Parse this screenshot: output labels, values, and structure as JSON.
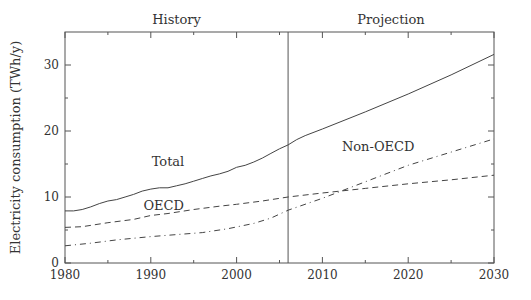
{
  "chart_data": {
    "type": "line",
    "title": "",
    "xlabel": "",
    "ylabel": "Electricity consumption (TWh/y)",
    "xlim": [
      1980,
      2030
    ],
    "ylim": [
      0,
      35
    ],
    "x_ticks": [
      "1980",
      "1990",
      "2000",
      "2010",
      "2020",
      "2030"
    ],
    "y_ticks": [
      "0",
      "10",
      "20",
      "30"
    ],
    "grid": false,
    "divider_year": 2006,
    "region_labels": [
      "History",
      "Projection"
    ],
    "series": [
      {
        "name": "Total",
        "style": "solid",
        "x": [
          1980,
          1981,
          1982,
          1983,
          1984,
          1985,
          1986,
          1987,
          1988,
          1989,
          1990,
          1991,
          1992,
          1993,
          1994,
          1995,
          1996,
          1997,
          1998,
          1999,
          2000,
          2001,
          2002,
          2003,
          2004,
          2005,
          2006,
          2007,
          2008,
          2010,
          2015,
          2020,
          2025,
          2030
        ],
        "values": [
          7.9,
          7.9,
          8.1,
          8.5,
          9.0,
          9.4,
          9.6,
          10.0,
          10.4,
          10.9,
          11.2,
          11.4,
          11.4,
          11.7,
          12.0,
          12.4,
          12.8,
          13.2,
          13.5,
          13.9,
          14.5,
          14.8,
          15.3,
          15.9,
          16.6,
          17.3,
          17.9,
          18.7,
          19.3,
          20.3,
          22.9,
          25.6,
          28.5,
          31.6
        ]
      },
      {
        "name": "OECD",
        "style": "dashed",
        "x": [
          1980,
          1982,
          1985,
          1988,
          1990,
          1992,
          1995,
          1998,
          2000,
          2003,
          2006,
          2010,
          2015,
          2020,
          2025,
          2030
        ],
        "values": [
          5.4,
          5.5,
          6.1,
          6.6,
          7.2,
          7.5,
          8.1,
          8.6,
          8.9,
          9.4,
          10.0,
          10.6,
          11.3,
          12.0,
          12.6,
          13.3
        ]
      },
      {
        "name": "Non-OECD",
        "style": "dash-dot",
        "x": [
          1980,
          1983,
          1986,
          1990,
          1993,
          1996,
          1999,
          2002,
          2004,
          2006,
          2010,
          2015,
          2020,
          2025,
          2030
        ],
        "values": [
          2.6,
          3.0,
          3.5,
          4.0,
          4.3,
          4.6,
          5.2,
          6.0,
          6.8,
          8.0,
          9.8,
          12.3,
          14.8,
          16.8,
          18.8
        ]
      }
    ],
    "annotations": [
      {
        "text": "Total",
        "x": 1992,
        "y": 15.5
      },
      {
        "text": "OECD",
        "x": 1991.5,
        "y": 8.8
      },
      {
        "text": "Non-OECD",
        "x": 2016.5,
        "y": 17.8
      }
    ]
  }
}
